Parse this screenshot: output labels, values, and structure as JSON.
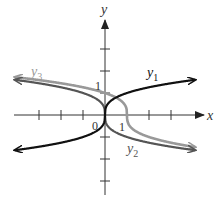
{
  "chart_data": {
    "type": "line",
    "title": "",
    "xlabel": "x",
    "ylabel": "y",
    "xlim": [
      -4.5,
      4.5
    ],
    "ylim": [
      -3.5,
      4.5
    ],
    "grid": false,
    "tick_labels": {
      "origin": "0",
      "x_one": "1",
      "y_one": "1"
    },
    "series": [
      {
        "name": "y1",
        "label": "y",
        "subscript": "1",
        "color": "#111111",
        "formula": "y = cbrt(x)",
        "x": [
          -4,
          -3,
          -2,
          -1,
          -0.5,
          0,
          0.5,
          1,
          2,
          3,
          4
        ],
        "y": [
          -1.59,
          -1.44,
          -1.26,
          -1.0,
          -0.79,
          0,
          0.79,
          1.0,
          1.26,
          1.44,
          1.59
        ]
      },
      {
        "name": "y2",
        "label": "y",
        "subscript": "2",
        "color": "#555555",
        "formula": "y = -cbrt(x)",
        "x": [
          -4,
          -3,
          -2,
          -1,
          -0.5,
          0,
          0.5,
          1,
          2,
          3,
          4
        ],
        "y": [
          1.59,
          1.44,
          1.26,
          1.0,
          0.79,
          0,
          -0.79,
          -1.0,
          -1.26,
          -1.44,
          -1.59
        ]
      },
      {
        "name": "y3",
        "label": "y",
        "subscript": "3",
        "color": "#999999",
        "formula": "y = -cbrt(x - 1)",
        "x": [
          -4,
          -3,
          -2,
          -1,
          0,
          0.5,
          1,
          1.5,
          2,
          3,
          4
        ],
        "y": [
          1.71,
          1.59,
          1.44,
          1.26,
          1.0,
          0.79,
          0,
          -0.79,
          -1.0,
          -1.26,
          -1.44
        ]
      }
    ]
  }
}
